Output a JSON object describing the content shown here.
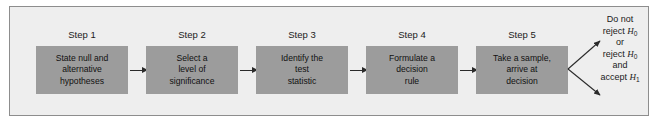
{
  "figure": {
    "background_color": "#eeeeee",
    "panel_border_color": "#8d8d8d",
    "box_fill_color": "#9c9c9c",
    "arrow_color": "#2a2a2a",
    "text_color": "#1a1a1a"
  },
  "steps": [
    {
      "label": "Step 1",
      "lines": [
        "State null and",
        "alternative",
        "hypotheses"
      ]
    },
    {
      "label": "Step 2",
      "lines": [
        "Select a",
        "level of",
        "significance"
      ]
    },
    {
      "label": "Step 3",
      "lines": [
        "Identify the",
        "test",
        "statistic"
      ]
    },
    {
      "label": "Step 4",
      "lines": [
        "Formulate a",
        "decision",
        "rule"
      ]
    },
    {
      "label": "Step 5",
      "lines": [
        "Take a sample,",
        "arrive at",
        "decision"
      ]
    }
  ],
  "conclusion": {
    "line1": "Do not",
    "line2_prefix": "reject ",
    "line2_symbol": "H",
    "line2_subscript": "0",
    "line3": "or",
    "line4_prefix": "reject ",
    "line4_symbol": "H",
    "line4_subscript": "0",
    "line5": "and",
    "line6_prefix": "accept ",
    "line6_symbol": "H",
    "line6_subscript": "1"
  }
}
